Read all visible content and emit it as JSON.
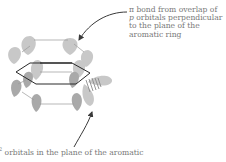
{
  "diagram": {
    "type": "benzene orbital diagram",
    "top_annotation": {
      "symbol": "π",
      "lines": [
        " bond from overlap of",
        "p",
        " orbitals perpendicular",
        "to the plane of the",
        "aromatic ring"
      ]
    },
    "bottom_annotation": {
      "superscript": "2",
      "text": " orbitals in the plane of the aromatic"
    },
    "colors": {
      "lobe_light": "#c8c8c8",
      "lobe_dark": "#a9a9a9",
      "ring": "#2a2a2a",
      "bond_line": "#9a9a9a",
      "arrow": "#3a3a3a",
      "text": "#777777"
    }
  }
}
